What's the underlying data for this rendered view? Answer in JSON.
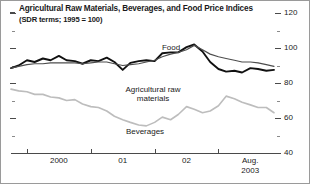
{
  "chart_data": {
    "type": "line",
    "title": "Agricultural Raw Materials, Beverages, and Food Price Indices",
    "subtitle": "(SDR terms; 1995 = 100)",
    "xlabel": "",
    "ylabel": "",
    "ylim": [
      40,
      120
    ],
    "yticks": [
      40,
      60,
      80,
      100,
      120
    ],
    "ytick_labels": [
      "40",
      "60",
      "80",
      "100",
      "120"
    ],
    "y_axis_position": "right",
    "minor_yticks": [
      50,
      70,
      90,
      110
    ],
    "grid": false,
    "legend": "inline-labels",
    "xticks": [
      1999.75,
      2000.75,
      2001.75,
      2002.75
    ],
    "xtick_labels": [
      "2000",
      "01",
      "02",
      "Aug.\n2003"
    ],
    "xlim": [
      1999.5,
      2003.62
    ],
    "x_end_label_line1": "Aug.",
    "x_end_label_line2": "2003",
    "series": [
      {
        "name": "Food",
        "color": "#111111",
        "width": 1.9,
        "x": [
          1999.5,
          1999.62,
          1999.75,
          1999.87,
          2000.0,
          2000.12,
          2000.25,
          2000.37,
          2000.5,
          2000.62,
          2000.75,
          2000.87,
          2001.0,
          2001.12,
          2001.25,
          2001.37,
          2001.5,
          2001.62,
          2001.75,
          2001.87,
          2002.0,
          2002.12,
          2002.25,
          2002.37,
          2002.5,
          2002.62,
          2002.75,
          2002.87,
          2003.0,
          2003.12,
          2003.25,
          2003.37,
          2003.5,
          2003.62
        ],
        "values": [
          88.5,
          90.0,
          93.0,
          92.0,
          94.0,
          93.0,
          95.5,
          93.0,
          92.5,
          91.0,
          93.0,
          92.5,
          94.5,
          92.0,
          87.5,
          91.5,
          92.5,
          93.0,
          92.5,
          97.0,
          97.5,
          97.5,
          100.5,
          102.0,
          98.0,
          92.0,
          88.0,
          86.5,
          87.0,
          86.0,
          88.5,
          88.0,
          87.0,
          87.5
        ]
      },
      {
        "name": "Agricultural raw materials",
        "color": "#4d4d4d",
        "width": 1.2,
        "x": [
          1999.5,
          1999.62,
          1999.75,
          1999.87,
          2000.0,
          2000.12,
          2000.25,
          2000.37,
          2000.5,
          2000.62,
          2000.75,
          2000.87,
          2001.0,
          2001.12,
          2001.25,
          2001.37,
          2001.5,
          2001.62,
          2001.75,
          2001.87,
          2002.0,
          2002.12,
          2002.25,
          2002.37,
          2002.5,
          2002.62,
          2002.75,
          2002.87,
          2003.0,
          2003.12,
          2003.25,
          2003.37,
          2003.5,
          2003.62
        ],
        "values": [
          88.5,
          89.5,
          90.5,
          91.0,
          91.0,
          91.5,
          91.5,
          91.5,
          91.5,
          91.0,
          91.5,
          92.0,
          92.0,
          91.0,
          90.0,
          90.5,
          91.0,
          92.0,
          93.0,
          95.0,
          96.5,
          97.5,
          99.0,
          101.5,
          99.0,
          96.5,
          95.0,
          94.0,
          93.0,
          92.0,
          92.0,
          91.5,
          90.5,
          89.5
        ]
      },
      {
        "name": "Beverages",
        "color": "#bdbdbd",
        "width": 1.6,
        "x": [
          1999.5,
          1999.62,
          1999.75,
          1999.87,
          2000.0,
          2000.12,
          2000.25,
          2000.37,
          2000.5,
          2000.62,
          2000.75,
          2000.87,
          2001.0,
          2001.12,
          2001.25,
          2001.37,
          2001.5,
          2001.62,
          2001.75,
          2001.87,
          2002.0,
          2002.12,
          2002.25,
          2002.37,
          2002.5,
          2002.62,
          2002.75,
          2002.87,
          2003.0,
          2003.12,
          2003.25,
          2003.37,
          2003.5,
          2003.62
        ],
        "values": [
          76.5,
          75.5,
          75.0,
          73.5,
          73.5,
          72.0,
          71.5,
          70.0,
          70.5,
          68.0,
          66.5,
          66.0,
          64.0,
          61.0,
          59.0,
          57.5,
          56.0,
          55.5,
          57.5,
          60.5,
          59.0,
          62.0,
          66.5,
          65.0,
          63.0,
          64.0,
          67.0,
          72.5,
          71.0,
          69.0,
          67.5,
          66.0,
          66.0,
          63.0
        ]
      }
    ],
    "annotations": [
      {
        "text": "Food",
        "x": 170,
        "y": 42
      },
      {
        "text": "Agricultural raw",
        "x": 152,
        "y": 84
      },
      {
        "text": "materials",
        "x": 152,
        "y": 93
      },
      {
        "text": "Beverages",
        "x": 144,
        "y": 126
      }
    ]
  }
}
